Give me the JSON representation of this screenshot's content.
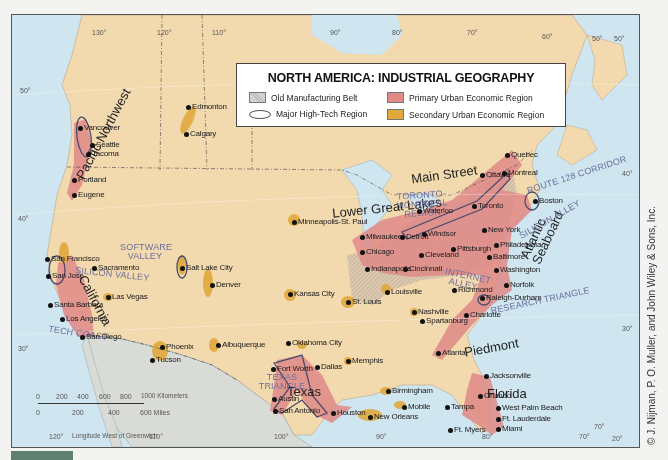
{
  "legend": {
    "title": "NORTH AMERICA: INDUSTRIAL GEOGRAPHY",
    "items": [
      {
        "key": "belt",
        "label": "Old Manufacturing Belt"
      },
      {
        "key": "primary",
        "label": "Primary Urban Economic Region"
      },
      {
        "key": "hightech",
        "label": "Major High-Tech Region"
      },
      {
        "key": "secondary",
        "label": "Secondary Urban Economic Region"
      }
    ]
  },
  "colors": {
    "land": "#f2d9ae",
    "water": "#cfe5ef",
    "primary": "#e08a88",
    "secondary": "#e0a93c",
    "mexico": "#d9dcd6",
    "tech_label": "#6b6f9e"
  },
  "graticule": {
    "top": [
      "130°",
      "120°",
      "110°",
      "90°",
      "80°",
      "70°",
      "60°"
    ],
    "bottom": [
      "120°",
      "110°",
      "100°",
      "90°",
      "80°",
      "70°",
      "20°"
    ],
    "left": [
      "50°",
      "40°",
      "30°"
    ],
    "right": [
      "50°",
      "50°",
      "40°",
      "30°",
      "70°"
    ]
  },
  "scale": {
    "km_ticks": [
      "0",
      "200",
      "400",
      "600",
      "800",
      "1000 Kilometers"
    ],
    "mi_ticks": [
      "0",
      "200",
      "400",
      "600 Miles"
    ],
    "longitude_label": "Longitude West of Greenwich"
  },
  "regions": {
    "pacific_northwest": "Pacific Northwest",
    "california": "California",
    "texas": "Texas",
    "lower_great_lakes": "Lower Great Lakes",
    "main_street": "Main Street",
    "atlantic_seaboard": "Atlantic Seaboard",
    "piedmont": "Piedmont",
    "florida": "Florida"
  },
  "tech_regions": {
    "software_valley": "SOFTWARE VALLEY",
    "silicon_valley": "SILICON VALLEY",
    "tech_coast": "TECH COAST",
    "texas_triangle": "TEXAS TRIANGLE",
    "toronto_montreal": "TORONTO-MONTREAL REGION",
    "route_128": "ROUTE 128 CORRIDOR",
    "silicon_alley": "SILICON ALLEY",
    "internet_alley": "INTERNET ALLEY",
    "research_triangle": "RESEARCH TRIANGLE"
  },
  "cities": [
    {
      "name": "Edmonton",
      "x": 176,
      "y": 92
    },
    {
      "name": "Calgary",
      "x": 174,
      "y": 119
    },
    {
      "name": "Vancouver",
      "x": 68,
      "y": 113
    },
    {
      "name": "Seattle",
      "x": 80,
      "y": 130
    },
    {
      "name": "Tacoma",
      "x": 76,
      "y": 139
    },
    {
      "name": "Portland",
      "x": 62,
      "y": 165
    },
    {
      "name": "Eugene",
      "x": 62,
      "y": 180
    },
    {
      "name": "Sacramento",
      "x": 82,
      "y": 253
    },
    {
      "name": "San Francisco",
      "x": 35,
      "y": 244
    },
    {
      "name": "San Jose",
      "x": 36,
      "y": 261
    },
    {
      "name": "Santa Barbara",
      "x": 38,
      "y": 290
    },
    {
      "name": "Los Angeles",
      "x": 50,
      "y": 304
    },
    {
      "name": "San Diego",
      "x": 70,
      "y": 322
    },
    {
      "name": "Las Vegas",
      "x": 96,
      "y": 282
    },
    {
      "name": "Salt Lake City",
      "x": 170,
      "y": 253
    },
    {
      "name": "Denver",
      "x": 200,
      "y": 270
    },
    {
      "name": "Phoenix",
      "x": 150,
      "y": 332
    },
    {
      "name": "Tucson",
      "x": 140,
      "y": 345
    },
    {
      "name": "Albuquerque",
      "x": 206,
      "y": 330
    },
    {
      "name": "Minneapolis-St. Paul",
      "x": 282,
      "y": 207
    },
    {
      "name": "Kansas City",
      "x": 278,
      "y": 279
    },
    {
      "name": "St. Louis",
      "x": 336,
      "y": 287
    },
    {
      "name": "Oklahoma City",
      "x": 276,
      "y": 328
    },
    {
      "name": "Memphis",
      "x": 336,
      "y": 346
    },
    {
      "name": "Fort Worth",
      "x": 261,
      "y": 354
    },
    {
      "name": "Dallas",
      "x": 305,
      "y": 352
    },
    {
      "name": "Austin",
      "x": 262,
      "y": 384
    },
    {
      "name": "San Antonio",
      "x": 263,
      "y": 396
    },
    {
      "name": "Houston",
      "x": 321,
      "y": 398
    },
    {
      "name": "Birmingham",
      "x": 376,
      "y": 376
    },
    {
      "name": "Mobile",
      "x": 392,
      "y": 392
    },
    {
      "name": "New Orleans",
      "x": 358,
      "y": 402
    },
    {
      "name": "Milwaukee",
      "x": 350,
      "y": 222
    },
    {
      "name": "Chicago",
      "x": 350,
      "y": 237
    },
    {
      "name": "Indianapolis",
      "x": 355,
      "y": 254
    },
    {
      "name": "Louisville",
      "x": 375,
      "y": 277
    },
    {
      "name": "Detroit",
      "x": 390,
      "y": 222
    },
    {
      "name": "Windsor",
      "x": 412,
      "y": 219
    },
    {
      "name": "Cleveland",
      "x": 409,
      "y": 240
    },
    {
      "name": "Cincinnati",
      "x": 393,
      "y": 254
    },
    {
      "name": "Pittsburgh",
      "x": 441,
      "y": 234
    },
    {
      "name": "Waterloo",
      "x": 407,
      "y": 196
    },
    {
      "name": "Toronto",
      "x": 462,
      "y": 191
    },
    {
      "name": "Ottawa",
      "x": 470,
      "y": 160
    },
    {
      "name": "Montreal",
      "x": 492,
      "y": 158
    },
    {
      "name": "Quebec",
      "x": 495,
      "y": 140
    },
    {
      "name": "Boston",
      "x": 523,
      "y": 186
    },
    {
      "name": "New York",
      "x": 472,
      "y": 215
    },
    {
      "name": "Philadelphia",
      "x": 484,
      "y": 230
    },
    {
      "name": "Baltimore",
      "x": 477,
      "y": 242
    },
    {
      "name": "Washington",
      "x": 484,
      "y": 255
    },
    {
      "name": "Richmond",
      "x": 442,
      "y": 275
    },
    {
      "name": "Norfolk",
      "x": 494,
      "y": 270
    },
    {
      "name": "Raleigh-Durham",
      "x": 470,
      "y": 283
    },
    {
      "name": "Nashville",
      "x": 402,
      "y": 297
    },
    {
      "name": "Charlotte",
      "x": 454,
      "y": 300
    },
    {
      "name": "Spartanburg",
      "x": 410,
      "y": 306
    },
    {
      "name": "Atlanta",
      "x": 426,
      "y": 338
    },
    {
      "name": "Jacksonville",
      "x": 474,
      "y": 361
    },
    {
      "name": "Orlando",
      "x": 468,
      "y": 381
    },
    {
      "name": "Tampa",
      "x": 435,
      "y": 392
    },
    {
      "name": "West Palm Beach",
      "x": 486,
      "y": 393
    },
    {
      "name": "Ft. Lauderdale",
      "x": 486,
      "y": 404
    },
    {
      "name": "Miami",
      "x": 486,
      "y": 414
    },
    {
      "name": "Ft. Myers",
      "x": 438,
      "y": 415
    }
  ],
  "credit": "© J. Nijman, P. O. Muller, and John Wiley & Sons, Inc."
}
